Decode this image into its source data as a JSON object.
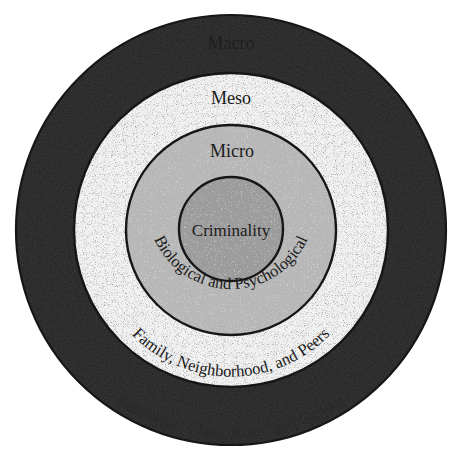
{
  "diagram": {
    "type": "concentric-circles",
    "center": {
      "x": 231,
      "y": 230
    },
    "colors": {
      "ring_stroke": "#161616",
      "macro_fill": "#4a4a4a",
      "meso_fill": "#eeeeee",
      "micro_fill": "#b8b8b8",
      "core_fill": "#9c9c9c",
      "text": "#1a1a1a"
    },
    "rings": [
      {
        "id": "macro",
        "radius": 215,
        "level_label": "Macro",
        "factors_label": "Economic, Class, Race, and Gender"
      },
      {
        "id": "meso",
        "radius": 157,
        "level_label": "Meso",
        "factors_label": "Family, Neighborhood, and Peers"
      },
      {
        "id": "micro",
        "radius": 105,
        "level_label": "Micro",
        "factors_label": "Biological and Psychological"
      },
      {
        "id": "core",
        "radius": 52,
        "level_label": "Criminality"
      }
    ]
  }
}
